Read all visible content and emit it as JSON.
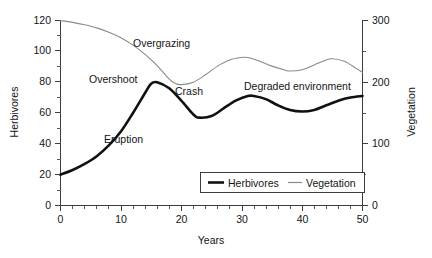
{
  "chart_data": {
    "type": "line",
    "title": "",
    "xlabel": "Years",
    "ylabel": "Herbivores",
    "y2label": "Vegetation",
    "xlim": [
      0,
      50
    ],
    "ylim": [
      0,
      120
    ],
    "y2lim": [
      0,
      300
    ],
    "grid": false,
    "legend_position": "lower-right-inside",
    "x_ticks": [
      0,
      10,
      20,
      30,
      40,
      50
    ],
    "x_tick_labels": [
      "0",
      "10",
      "20",
      "30",
      "40",
      "50"
    ],
    "x_minor_step": 2,
    "y_ticks": [
      0,
      20,
      40,
      60,
      80,
      100,
      120
    ],
    "y_tick_labels": [
      "0",
      "20",
      "40",
      "60",
      "80",
      "100",
      "120"
    ],
    "y2_ticks": [
      0,
      100,
      200,
      300
    ],
    "y2_tick_labels": [
      "0",
      "100",
      "200",
      "300"
    ],
    "y2_minor_step": 50,
    "series": [
      {
        "name": "Herbivores",
        "axis": "left",
        "color": "#111111",
        "width": 2.6,
        "x": [
          0,
          2,
          4,
          6,
          8,
          10,
          12,
          14,
          15,
          16,
          18,
          20,
          22,
          23,
          25,
          27,
          29,
          31,
          32,
          34,
          36,
          38,
          40,
          42,
          44,
          46,
          48,
          50
        ],
        "values": [
          20,
          23,
          27,
          32,
          39,
          48,
          60,
          73,
          79,
          80,
          76,
          68,
          59,
          57,
          58,
          63,
          68,
          71,
          71,
          69,
          65,
          62,
          61,
          62,
          65,
          68,
          70,
          71
        ]
      },
      {
        "name": "Vegetation",
        "axis": "right",
        "color": "#8a8a8a",
        "width": 1.1,
        "x": [
          0,
          2,
          4,
          6,
          8,
          10,
          12,
          14,
          16,
          18,
          19,
          20,
          22,
          24,
          26,
          28,
          30,
          31,
          33,
          35,
          37,
          38,
          40,
          42,
          44,
          45,
          47,
          49,
          50
        ],
        "values": [
          300,
          297,
          293,
          288,
          281,
          272,
          260,
          245,
          227,
          205,
          198,
          196,
          200,
          212,
          226,
          236,
          240,
          240,
          234,
          226,
          220,
          218,
          220,
          228,
          236,
          238,
          234,
          222,
          216
        ]
      }
    ],
    "annotations": [
      {
        "text": "Overgrazing",
        "x": 18.5,
        "y_left": 101,
        "note": "on vegetation decline"
      },
      {
        "text": "Overshoot",
        "x": 11.0,
        "y_left": 83,
        "note": "on herbivore rise"
      },
      {
        "text": "Crash",
        "x": 22.5,
        "y_left": 74,
        "note": "after herbivore peak"
      },
      {
        "text": "Eruption",
        "x": 10.5,
        "y_left": 47,
        "note": "early herbivore growth"
      },
      {
        "text": "Degraded environment",
        "x": 38.0,
        "y_left": 78,
        "note": "late oscillation"
      }
    ]
  },
  "legend": {
    "entries": [
      {
        "label": "Herbivores",
        "color": "#111111",
        "style": "thick"
      },
      {
        "label": "Vegetation",
        "color": "#8a8a8a",
        "style": "thin"
      }
    ]
  }
}
